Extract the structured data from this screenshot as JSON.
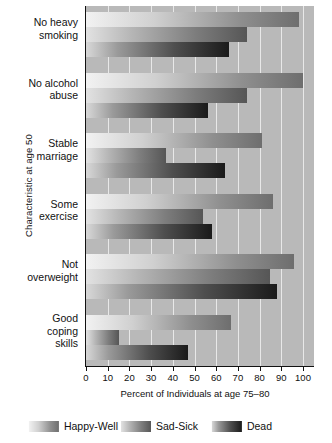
{
  "chart_data": {
    "type": "bar",
    "orientation": "horizontal",
    "title": "",
    "xlabel": "Percent of Individuals at age 75–80",
    "ylabel": "Characteristic at age 50",
    "xlim": [
      0,
      105
    ],
    "xticks": [
      0,
      10,
      20,
      30,
      40,
      50,
      60,
      70,
      80,
      90,
      100
    ],
    "xticklabels": [
      "0",
      "10",
      "20",
      "30",
      "40",
      "50",
      "60",
      "70",
      "80",
      "90",
      "100"
    ],
    "grid": true,
    "grid_axis": "x",
    "legend_position": "bottom",
    "categories": [
      "No heavy smoking",
      "No alcohol abuse",
      "Stable marriage",
      "Some exercise",
      "Not overweight",
      "Good coping skills"
    ],
    "category_lines": [
      [
        "No heavy",
        "smoking"
      ],
      [
        "No alcohol",
        "abuse"
      ],
      [
        "Stable",
        "marriage"
      ],
      [
        "Some",
        "exercise"
      ],
      [
        "Not",
        "overweight"
      ],
      [
        "Good",
        "coping",
        "skills"
      ]
    ],
    "series": [
      {
        "name": "Happy-Well",
        "color": "#a8a8a8",
        "values": [
          98,
          100,
          81,
          86,
          96,
          67
        ]
      },
      {
        "name": "Sad-Sick",
        "color": "#7d7d7d",
        "values": [
          74,
          74,
          37,
          54,
          85,
          15
        ]
      },
      {
        "name": "Dead",
        "color": "#2b2b2b",
        "values": [
          66,
          56,
          64,
          58,
          88,
          47
        ]
      }
    ]
  },
  "legend": {
    "items": [
      {
        "label": "Happy-Well",
        "swatch": "happy"
      },
      {
        "label": "Sad-Sick",
        "swatch": "sad"
      },
      {
        "label": "Dead",
        "swatch": "dead"
      }
    ]
  }
}
